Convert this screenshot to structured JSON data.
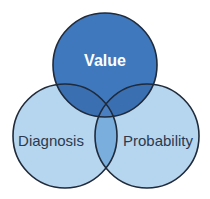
{
  "diagram": {
    "type": "venn",
    "circles": [
      {
        "id": "value",
        "label": "Value",
        "cx": 105,
        "cy": 65,
        "r": 52,
        "fill": "#3f78bd",
        "text_color": "#ffffff"
      },
      {
        "id": "diagnosis",
        "label": "Diagnosis",
        "cx": 65,
        "cy": 136,
        "r": 52,
        "fill": "#b6d5ef",
        "text_color": "#2b3a4e"
      },
      {
        "id": "probability",
        "label": "Probability",
        "cx": 147,
        "cy": 136,
        "r": 52,
        "fill": "#b6d5ef",
        "text_color": "#2b3a4e"
      }
    ],
    "colors": {
      "outline": "#1f2a3a",
      "bottom_overlap": "#7aaedc",
      "top_overlap": "#3a6db0"
    }
  }
}
